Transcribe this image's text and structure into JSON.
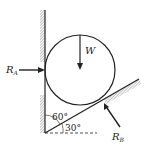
{
  "diagram": {
    "type": "statics free-body diagram",
    "labels": {
      "weight": "W",
      "reaction_a": "R",
      "reaction_a_sub": "A",
      "reaction_b": "R",
      "reaction_b_sub": "B",
      "angle_wall": "60°",
      "angle_incline": "30°"
    },
    "colors": {
      "line": "#222222",
      "hatch": "#888888",
      "background": "#ffffff"
    }
  }
}
